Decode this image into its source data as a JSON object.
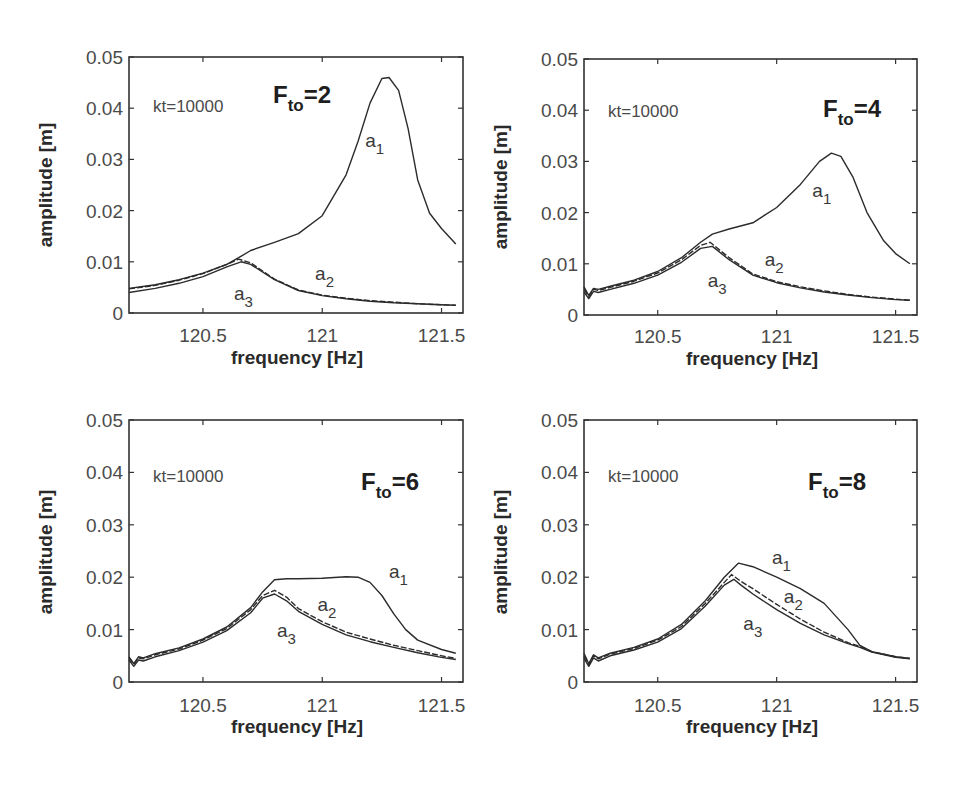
{
  "chart_data": [
    {
      "type": "line",
      "title": "F_t0=2",
      "annotation": "kt=10000",
      "xlabel": "frequency  [Hz]",
      "ylabel": "amplitude [m]",
      "xlim": [
        120.19,
        121.59
      ],
      "ylim": [
        0,
        0.05
      ],
      "xticks": [
        120.5,
        121,
        121.5
      ],
      "xtick_labels": [
        "120.5",
        "121",
        "121.5"
      ],
      "yticks": [
        0,
        0.01,
        0.02,
        0.03,
        0.04,
        0.05
      ],
      "ytick_labels": [
        "0",
        "0.01",
        "0.02",
        "0.03",
        "0.04",
        "0.05"
      ],
      "grid": false,
      "legend": "inline labels",
      "series": [
        {
          "name": "a1",
          "x": [
            120.19,
            120.3,
            120.4,
            120.5,
            120.6,
            120.65,
            120.7,
            120.8,
            120.9,
            121.0,
            121.1,
            121.15,
            121.2,
            121.25,
            121.28,
            121.32,
            121.36,
            121.4,
            121.45,
            121.5,
            121.56
          ],
          "y": [
            0.0048,
            0.0055,
            0.0065,
            0.0078,
            0.0095,
            0.0108,
            0.0122,
            0.0138,
            0.0155,
            0.019,
            0.027,
            0.0335,
            0.041,
            0.0458,
            0.046,
            0.0435,
            0.036,
            0.026,
            0.0195,
            0.0165,
            0.0135
          ]
        },
        {
          "name": "a2",
          "x": [
            120.19,
            120.3,
            120.4,
            120.5,
            120.6,
            120.65,
            120.7,
            120.8,
            120.9,
            121.0,
            121.1,
            121.2,
            121.3,
            121.4,
            121.5,
            121.56
          ],
          "y": [
            0.0047,
            0.0054,
            0.0064,
            0.0077,
            0.0095,
            0.0105,
            0.0098,
            0.0066,
            0.0045,
            0.0035,
            0.0029,
            0.0024,
            0.0021,
            0.0018,
            0.0016,
            0.0015
          ]
        },
        {
          "name": "a3",
          "x": [
            120.19,
            120.3,
            120.4,
            120.5,
            120.6,
            120.66,
            120.7,
            120.8,
            120.9,
            121.0,
            121.1,
            121.2,
            121.3,
            121.4,
            121.5,
            121.56
          ],
          "y": [
            0.004,
            0.0048,
            0.0058,
            0.0071,
            0.009,
            0.01,
            0.0095,
            0.0065,
            0.0044,
            0.0034,
            0.0028,
            0.0023,
            0.002,
            0.0018,
            0.0016,
            0.0015
          ]
        }
      ],
      "labels": [
        {
          "text": "a",
          "sub": "1",
          "x": 121.18,
          "y": 0.0325
        },
        {
          "text": "a",
          "sub": "2",
          "x": 120.97,
          "y": 0.0065
        },
        {
          "text": "a",
          "sub": "3",
          "x": 120.63,
          "y": 0.0025
        }
      ]
    },
    {
      "type": "line",
      "title": "F_t0=4",
      "annotation": "kt=10000",
      "xlabel": "frequency  [Hz]",
      "ylabel": "amplitude [m]",
      "xlim": [
        120.19,
        121.59
      ],
      "ylim": [
        0,
        0.05
      ],
      "xticks": [
        120.5,
        121,
        121.5
      ],
      "xtick_labels": [
        "120.5",
        "121",
        "121.5"
      ],
      "yticks": [
        0,
        0.01,
        0.02,
        0.03,
        0.04,
        0.05
      ],
      "ytick_labels": [
        "0",
        "0.01",
        "0.02",
        "0.03",
        "0.04",
        "0.05"
      ],
      "grid": false,
      "legend": "inline labels",
      "series": [
        {
          "name": "a1",
          "x": [
            120.19,
            120.21,
            120.23,
            120.25,
            120.3,
            120.4,
            120.5,
            120.6,
            120.68,
            120.73,
            120.8,
            120.9,
            121.0,
            121.1,
            121.18,
            121.23,
            121.27,
            121.32,
            121.38,
            121.45,
            121.5,
            121.56
          ],
          "y": [
            0.0055,
            0.0038,
            0.0052,
            0.005,
            0.0056,
            0.0068,
            0.0085,
            0.0112,
            0.0142,
            0.0158,
            0.0168,
            0.018,
            0.021,
            0.0255,
            0.03,
            0.0316,
            0.031,
            0.027,
            0.02,
            0.0145,
            0.012,
            0.01
          ]
        },
        {
          "name": "a2",
          "x": [
            120.19,
            120.21,
            120.23,
            120.25,
            120.3,
            120.4,
            120.5,
            120.6,
            120.68,
            120.72,
            120.8,
            120.9,
            121.0,
            121.1,
            121.2,
            121.3,
            121.4,
            121.5,
            121.56
          ],
          "y": [
            0.005,
            0.0036,
            0.005,
            0.0048,
            0.0054,
            0.0066,
            0.0082,
            0.0108,
            0.0136,
            0.0142,
            0.0112,
            0.008,
            0.0065,
            0.0055,
            0.0047,
            0.004,
            0.0035,
            0.0031,
            0.0029
          ]
        },
        {
          "name": "a3",
          "x": [
            120.19,
            120.21,
            120.23,
            120.25,
            120.3,
            120.4,
            120.5,
            120.6,
            120.68,
            120.73,
            120.8,
            120.9,
            121.0,
            121.1,
            121.2,
            121.3,
            121.4,
            121.5,
            121.56
          ],
          "y": [
            0.0045,
            0.0032,
            0.0046,
            0.0044,
            0.005,
            0.0062,
            0.0078,
            0.0103,
            0.013,
            0.0134,
            0.0108,
            0.0078,
            0.0063,
            0.0053,
            0.0045,
            0.0039,
            0.0034,
            0.003,
            0.0029
          ]
        }
      ],
      "labels": [
        {
          "text": "a",
          "sub": "1",
          "x": 121.15,
          "y": 0.023
        },
        {
          "text": "a",
          "sub": "2",
          "x": 120.95,
          "y": 0.0095
        },
        {
          "text": "a",
          "sub": "3",
          "x": 120.71,
          "y": 0.0055
        }
      ]
    },
    {
      "type": "line",
      "title": "F_t0=6",
      "annotation": "kt=10000",
      "xlabel": "frequency  [Hz]",
      "ylabel": "amplitude [m]",
      "xlim": [
        120.19,
        121.59
      ],
      "ylim": [
        0,
        0.05
      ],
      "xticks": [
        120.5,
        121,
        121.5
      ],
      "xtick_labels": [
        "120.5",
        "121",
        "121.5"
      ],
      "yticks": [
        0,
        0.01,
        0.02,
        0.03,
        0.04,
        0.05
      ],
      "ytick_labels": [
        "0",
        "0.01",
        "0.02",
        "0.03",
        "0.04",
        "0.05"
      ],
      "grid": false,
      "legend": "inline labels",
      "series": [
        {
          "name": "a1",
          "x": [
            120.19,
            120.21,
            120.23,
            120.25,
            120.3,
            120.4,
            120.5,
            120.6,
            120.7,
            120.75,
            120.8,
            120.85,
            120.9,
            121.0,
            121.1,
            121.15,
            121.2,
            121.25,
            121.3,
            121.35,
            121.4,
            121.5,
            121.56
          ],
          "y": [
            0.0048,
            0.0035,
            0.0048,
            0.0046,
            0.0054,
            0.0065,
            0.0082,
            0.0105,
            0.0142,
            0.0172,
            0.0195,
            0.0197,
            0.0197,
            0.0198,
            0.0201,
            0.02,
            0.019,
            0.0165,
            0.013,
            0.01,
            0.008,
            0.0062,
            0.0055
          ]
        },
        {
          "name": "a2",
          "x": [
            120.19,
            120.21,
            120.23,
            120.25,
            120.3,
            120.4,
            120.5,
            120.6,
            120.7,
            120.75,
            120.8,
            120.85,
            120.9,
            121.0,
            121.1,
            121.2,
            121.3,
            121.4,
            121.5,
            121.56
          ],
          "y": [
            0.0046,
            0.0034,
            0.0046,
            0.0044,
            0.0052,
            0.0063,
            0.008,
            0.0102,
            0.0138,
            0.0165,
            0.0175,
            0.0162,
            0.014,
            0.0115,
            0.0095,
            0.0082,
            0.007,
            0.006,
            0.005,
            0.0045
          ]
        },
        {
          "name": "a3",
          "x": [
            120.19,
            120.21,
            120.23,
            120.25,
            120.3,
            120.4,
            120.5,
            120.6,
            120.7,
            120.75,
            120.8,
            120.85,
            120.9,
            121.0,
            121.1,
            121.2,
            121.3,
            121.4,
            121.5,
            121.56
          ],
          "y": [
            0.0042,
            0.003,
            0.0042,
            0.004,
            0.0048,
            0.006,
            0.0076,
            0.0098,
            0.0132,
            0.016,
            0.0168,
            0.0155,
            0.0135,
            0.011,
            0.009,
            0.0077,
            0.0066,
            0.0056,
            0.0047,
            0.0043
          ]
        }
      ],
      "labels": [
        {
          "text": "a",
          "sub": "1",
          "x": 121.28,
          "y": 0.0198
        },
        {
          "text": "a",
          "sub": "2",
          "x": 120.98,
          "y": 0.0135
        },
        {
          "text": "a",
          "sub": "3",
          "x": 120.81,
          "y": 0.0085
        }
      ]
    },
    {
      "type": "line",
      "title": "F_t0=8",
      "annotation": "kt=10000",
      "xlabel": "frequency  [Hz]",
      "ylabel": "amplitude [m]",
      "xlim": [
        120.19,
        121.59
      ],
      "ylim": [
        0,
        0.05
      ],
      "xticks": [
        120.5,
        121,
        121.5
      ],
      "xtick_labels": [
        "120.5",
        "121",
        "121.5"
      ],
      "yticks": [
        0,
        0.01,
        0.02,
        0.03,
        0.04,
        0.05
      ],
      "ytick_labels": [
        "0",
        "0.01",
        "0.02",
        "0.03",
        "0.04",
        "0.05"
      ],
      "grid": false,
      "legend": "inline labels",
      "series": [
        {
          "name": "a1",
          "x": [
            120.19,
            120.21,
            120.23,
            120.25,
            120.3,
            120.4,
            120.5,
            120.6,
            120.7,
            120.78,
            120.82,
            120.84,
            120.9,
            121.0,
            121.1,
            121.2,
            121.3,
            121.35,
            121.4,
            121.5,
            121.56
          ],
          "y": [
            0.0055,
            0.0035,
            0.0052,
            0.0046,
            0.0055,
            0.0066,
            0.0082,
            0.011,
            0.0155,
            0.02,
            0.0218,
            0.0227,
            0.022,
            0.02,
            0.0178,
            0.015,
            0.01,
            0.007,
            0.0058,
            0.0048,
            0.0045
          ]
        },
        {
          "name": "a2",
          "x": [
            120.19,
            120.21,
            120.23,
            120.25,
            120.3,
            120.4,
            120.5,
            120.6,
            120.7,
            120.78,
            120.81,
            120.85,
            120.9,
            121.0,
            121.1,
            121.2,
            121.3,
            121.35,
            121.4,
            121.5,
            121.56
          ],
          "y": [
            0.005,
            0.0033,
            0.005,
            0.0044,
            0.0053,
            0.0064,
            0.008,
            0.0106,
            0.015,
            0.019,
            0.0205,
            0.0192,
            0.0178,
            0.0148,
            0.012,
            0.0095,
            0.0075,
            0.0068,
            0.0058,
            0.0048,
            0.0045
          ]
        },
        {
          "name": "a3",
          "x": [
            120.19,
            120.21,
            120.23,
            120.25,
            120.3,
            120.4,
            120.5,
            120.6,
            120.7,
            120.78,
            120.82,
            120.85,
            120.9,
            121.0,
            121.1,
            121.2,
            121.3,
            121.35,
            121.4,
            121.5,
            121.56
          ],
          "y": [
            0.0045,
            0.003,
            0.0046,
            0.004,
            0.005,
            0.0061,
            0.0076,
            0.0102,
            0.0145,
            0.0185,
            0.0196,
            0.0185,
            0.0168,
            0.0138,
            0.0112,
            0.009,
            0.0073,
            0.0066,
            0.0057,
            0.0047,
            0.0044
          ]
        }
      ],
      "labels": [
        {
          "text": "a",
          "sub": "1",
          "x": 120.98,
          "y": 0.0225
        },
        {
          "text": "a",
          "sub": "2",
          "x": 121.03,
          "y": 0.015
        },
        {
          "text": "a",
          "sub": "3",
          "x": 120.86,
          "y": 0.01
        }
      ]
    }
  ],
  "panels": [
    {
      "annotation": "kt=10000",
      "title_main": "F",
      "title_sub": "to",
      "title_rest": "=2",
      "ylabel": "amplitude [m]",
      "xlabel": "frequency  [Hz]"
    },
    {
      "annotation": "kt=10000",
      "title_main": "F",
      "title_sub": "to",
      "title_rest": "=4",
      "ylabel": "amplitude [m]",
      "xlabel": "frequency  [Hz]"
    },
    {
      "annotation": "kt=10000",
      "title_main": "F",
      "title_sub": "to",
      "title_rest": "=6",
      "ylabel": "amplitude [m]",
      "xlabel": "frequency  [Hz]"
    },
    {
      "annotation": "kt=10000",
      "title_main": "F",
      "title_sub": "to",
      "title_rest": "=8",
      "ylabel": "amplitude [m]",
      "xlabel": "frequency  [Hz]"
    }
  ],
  "colors": {
    "curve": "#2b2b2b",
    "axis": "#333333",
    "text": "#4a4a4a",
    "background": "#ffffff"
  }
}
